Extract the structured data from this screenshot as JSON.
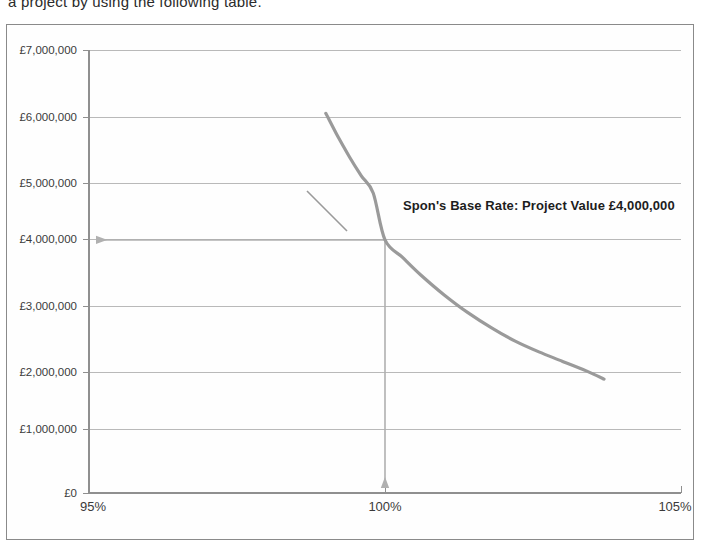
{
  "document": {
    "body_text": "a project by using the following table."
  },
  "figure": {
    "name": "project-value-vs-percentage-chart"
  },
  "chart_data": {
    "type": "line",
    "title": "",
    "subtitle": "",
    "xlabel": "",
    "ylabel": "",
    "xlim": [
      95,
      105
    ],
    "ylim": [
      0,
      7000000
    ],
    "grid": true,
    "legend": "none",
    "series": [
      {
        "name": "Project Value",
        "color": "#9a9a9a",
        "x": [
          99.0,
          99.2,
          99.4,
          99.6,
          99.8,
          100.0,
          100.3,
          100.6,
          101.0,
          101.4,
          101.8,
          102.2,
          102.6,
          103.0,
          103.4,
          103.7
        ],
        "values": [
          6000000,
          5640000,
          5310000,
          5010000,
          4740000,
          4000000,
          3720000,
          3450000,
          3130000,
          2850000,
          2610000,
          2400000,
          2230000,
          2080000,
          1930000,
          1800000
        ]
      }
    ],
    "categories": [],
    "x_ticks": [
      {
        "value": 95,
        "label": "95%"
      },
      {
        "value": 100,
        "label": "100%"
      },
      {
        "value": 105,
        "label": "105%"
      }
    ],
    "y_ticks": [
      {
        "value": 0,
        "label": "£0"
      },
      {
        "value": 1000000,
        "label": "£1,000,000"
      },
      {
        "value": 2000000,
        "label": "£2,000,000"
      },
      {
        "value": 3000000,
        "label": "£3,000,000"
      },
      {
        "value": 4000000,
        "label": "£4,000,000"
      },
      {
        "value": 5000000,
        "label": "£5,000,000"
      },
      {
        "value": 6000000,
        "label": "£6,000,000"
      },
      {
        "value": 7000000,
        "label": "£7,000,000"
      }
    ],
    "annotations": [
      {
        "text": "Spon's Base Rate: Project Value £4,000,000",
        "x": 100,
        "y": 4000000,
        "marker_color": "#b0b0b0"
      }
    ]
  }
}
